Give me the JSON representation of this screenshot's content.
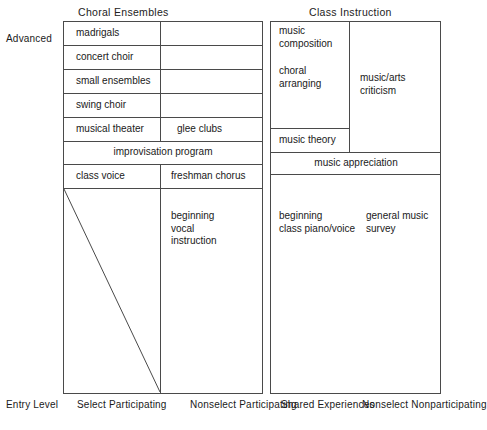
{
  "figure": {
    "headers": {
      "left": "Choral Ensembles",
      "right": "Class Instruction"
    },
    "vertical_axis": {
      "top_label": "Advanced",
      "bottom_label": "Entry Level"
    },
    "column_labels": [
      "Select\nParticipating",
      "Nonselect\nParticipating",
      "Shared\nExperiences",
      "Nonselect\nNonparticipating"
    ],
    "cells": {
      "madrigals": "madrigals",
      "concert_choir": "concert choir",
      "small_ensembles": "small ensembles",
      "swing_choir": "swing choir",
      "musical_theater": "musical theater",
      "glee_clubs": "glee clubs",
      "improvisation_program": "improvisation program",
      "class_voice": "class voice",
      "freshman_chorus": "freshman chorus",
      "beginning_vocal_instruction": "beginning\nvocal\ninstruction",
      "music_composition": "music\ncomposition",
      "choral_arranging": "choral\narranging",
      "music_arts_criticism": "music/arts\ncriticism",
      "music_theory": "music theory",
      "music_appreciation": "music appreciation",
      "beginning_class_piano_voice": "beginning\nclass piano/voice",
      "general_music_survey": "general music\nsurvey"
    },
    "colors": {
      "line": "#4a4a4a",
      "text": "#1a1a1a",
      "background": "#ffffff"
    }
  }
}
